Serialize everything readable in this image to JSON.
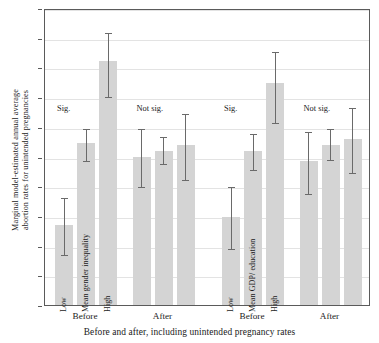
{
  "chart_data": {
    "type": "bar",
    "title": "",
    "subtitle": "",
    "ylabel": "Marginal model-estimated annual average abortion rates for unintended pregnancies",
    "ylabel_lines": [
      "Marginal model-estimated annual average",
      "abortion rates for unintended pregnancies"
    ],
    "xlabel": "Before and after, including unintended pregnancy rates",
    "ylim": [
      0,
      50
    ],
    "yticks": [
      0,
      5,
      10,
      15,
      20,
      25,
      30,
      35,
      40,
      45,
      50
    ],
    "ytick_labels": [
      "0",
      "5",
      "10",
      "15",
      "20",
      "25",
      "30",
      "35",
      "40",
      "45",
      "50"
    ],
    "grid": true,
    "legend": "none",
    "categories": [
      "Low",
      "Mean",
      "High"
    ],
    "bar_color": "#d4d4d4",
    "error_color": "#6a6a6a",
    "groups": [
      {
        "group_label": "Before",
        "panel": "Mean gender inequality",
        "significance": "Sig.",
        "bars": [
          {
            "category": "Low",
            "label": "Low",
            "value": 13.5,
            "ci_low": 8.8,
            "ci_high": 18.3
          },
          {
            "category": "Mean",
            "label": "Mean gender inequality",
            "value": 27.3,
            "ci_low": 24.5,
            "ci_high": 30.0
          },
          {
            "category": "High",
            "label": "High",
            "value": 41.0,
            "ci_low": 35.4,
            "ci_high": 46.2
          }
        ]
      },
      {
        "group_label": "After",
        "panel": "Mean gender inequality",
        "significance": "Not sig.",
        "bars": [
          {
            "category": "Low",
            "label": "",
            "value": 25.0,
            "ci_low": 20.2,
            "ci_high": 30.0
          },
          {
            "category": "Mean",
            "label": "",
            "value": 26.0,
            "ci_low": 24.0,
            "ci_high": 28.6
          },
          {
            "category": "High",
            "label": "",
            "value": 27.0,
            "ci_low": 21.4,
            "ci_high": 32.5
          }
        ]
      },
      {
        "group_label": "Before",
        "panel": "Mean GDP/ education",
        "significance": "Sig.",
        "bars": [
          {
            "category": "Low",
            "label": "Low",
            "value": 14.9,
            "ci_low": 9.8,
            "ci_high": 20.2
          },
          {
            "category": "Mean",
            "label": "Mean GDP/ education",
            "value": 26.0,
            "ci_low": 23.0,
            "ci_high": 29.2
          },
          {
            "category": "High",
            "label": "High",
            "value": 37.3,
            "ci_low": 31.0,
            "ci_high": 43.0
          }
        ]
      },
      {
        "group_label": "After",
        "panel": "Mean GDP/ education",
        "significance": "Not sig.",
        "bars": [
          {
            "category": "Low",
            "label": "",
            "value": 24.2,
            "ci_low": 19.0,
            "ci_high": 29.5
          },
          {
            "category": "Mean",
            "label": "",
            "value": 27.0,
            "ci_low": 24.8,
            "ci_high": 30.0
          },
          {
            "category": "High",
            "label": "",
            "value": 28.0,
            "ci_low": 22.5,
            "ci_high": 33.5
          }
        ]
      }
    ]
  }
}
